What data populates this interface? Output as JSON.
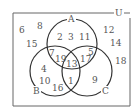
{
  "diagram": {
    "type": "venn",
    "universe_label": "U",
    "sets": [
      {
        "name": "A",
        "label": "A"
      },
      {
        "name": "B",
        "label": "B"
      },
      {
        "name": "C",
        "label": "C"
      }
    ],
    "regions": {
      "outside": [
        "6",
        "8",
        "15",
        "12",
        "14",
        "18"
      ],
      "A_only": [
        "2",
        "3",
        "11"
      ],
      "A_and_B_only": [
        "7",
        "19"
      ],
      "A_and_C_only": [
        "5",
        "17"
      ],
      "A_and_B_and_C": [
        "13"
      ],
      "B_only": [
        "4",
        "10",
        "16"
      ],
      "B_and_C_only": [
        "1"
      ],
      "C_only": [
        "9"
      ]
    }
  }
}
